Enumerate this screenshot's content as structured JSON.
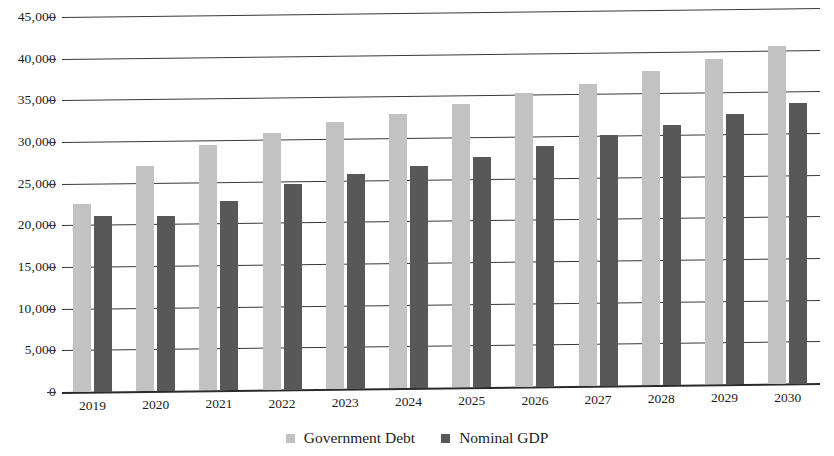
{
  "chart_data": {
    "type": "bar",
    "title": "",
    "subtitle": "",
    "xlabel": "",
    "ylabel": "",
    "categories": [
      "2019",
      "2020",
      "2021",
      "2022",
      "2023",
      "2024",
      "2025",
      "2026",
      "2027",
      "2028",
      "2029",
      "2030"
    ],
    "series": [
      {
        "name": "Government Debt",
        "color": "#c2c2c2",
        "values": [
          22600,
          27000,
          29400,
          30800,
          32000,
          32900,
          34000,
          35200,
          36200,
          37700,
          39000,
          40500
        ]
      },
      {
        "name": "Nominal GDP",
        "color": "#585858",
        "values": [
          21100,
          21000,
          22700,
          24700,
          25800,
          26700,
          27700,
          28900,
          30100,
          31200,
          32500,
          33700
        ]
      }
    ],
    "ylim": [
      0,
      45000
    ],
    "ytick_values": [
      0,
      5000,
      10000,
      15000,
      20000,
      25000,
      30000,
      35000,
      40000,
      45000
    ],
    "ytick_labels": [
      "0",
      "5,000",
      "10,000",
      "15,000",
      "20,000",
      "25,000",
      "30,000",
      "35,000",
      "40,000",
      "45,000"
    ],
    "grid": true,
    "grid_axis": "y",
    "legend_position": "bottom",
    "legend_entries": [
      "Government Debt",
      "Nominal GDP"
    ]
  }
}
